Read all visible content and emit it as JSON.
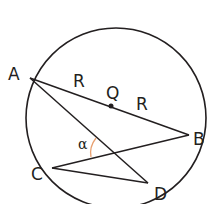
{
  "diagram": {
    "type": "circle-geometry",
    "circle": {
      "center_label": "Q"
    },
    "points": {
      "A": "A",
      "B": "B",
      "C": "C",
      "D": "D",
      "Q": "Q"
    },
    "segment_labels": {
      "AQ": "R",
      "QB": "R"
    },
    "angle_label": "α",
    "colors": {
      "stroke": "#231f20",
      "angle_arc": "#e8a070"
    }
  }
}
